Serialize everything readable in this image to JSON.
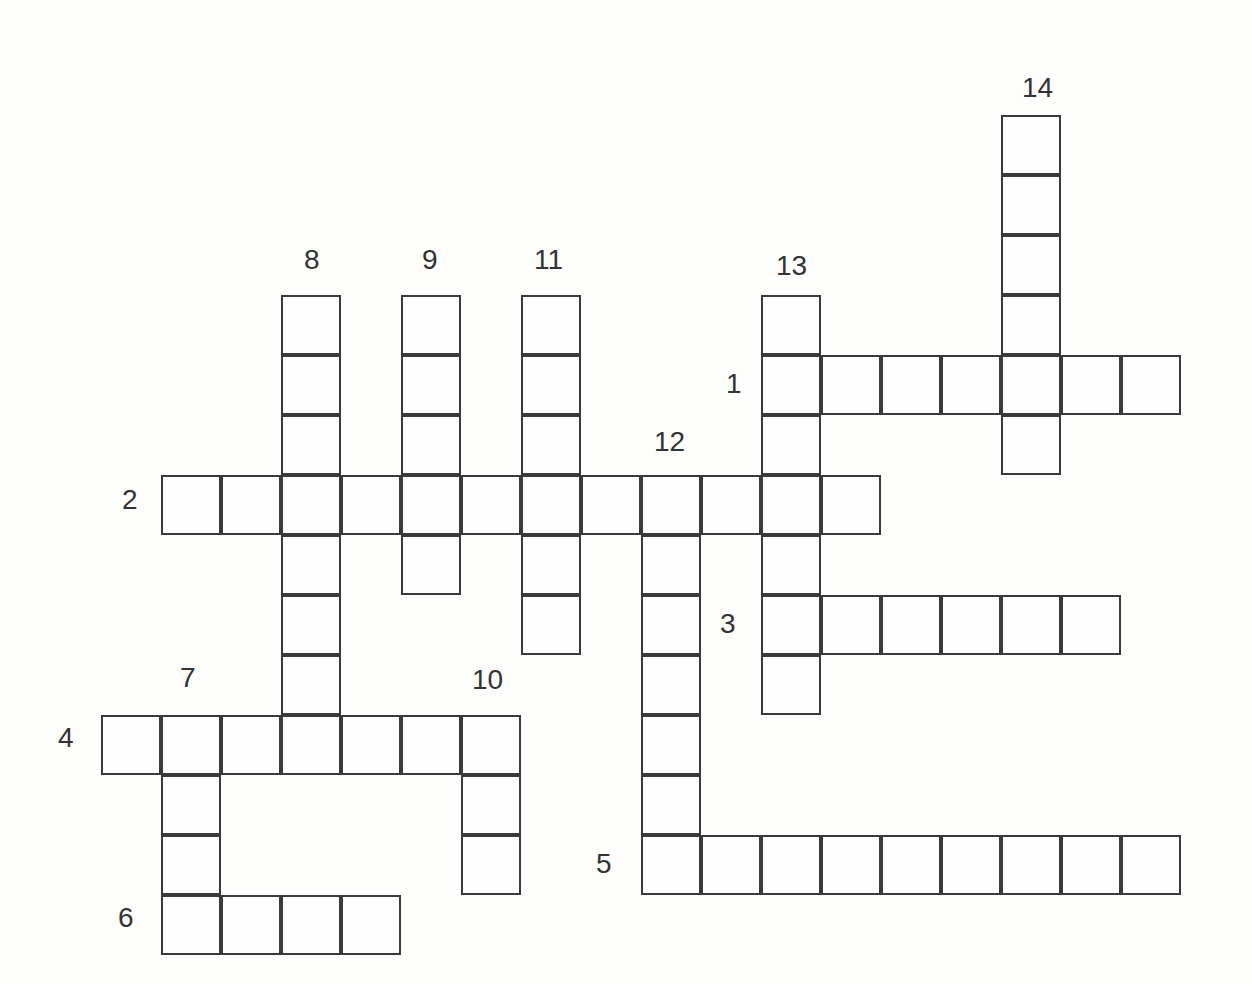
{
  "puzzle": {
    "type": "crossword",
    "origin": {
      "x": 102,
      "y": 116
    },
    "cell_size": 60,
    "line_color": "#3a3a3a",
    "background": "#fdfdfc",
    "entries": [
      {
        "number": "1",
        "direction": "across",
        "row": 4,
        "col": 11,
        "length": 7,
        "label_pos": {
          "x": 726,
          "y": 370
        }
      },
      {
        "number": "2",
        "direction": "across",
        "row": 6,
        "col": 1,
        "length": 12,
        "label_pos": {
          "x": 122,
          "y": 486
        }
      },
      {
        "number": "3",
        "direction": "across",
        "row": 8,
        "col": 11,
        "length": 6,
        "label_pos": {
          "x": 720,
          "y": 610
        }
      },
      {
        "number": "4",
        "direction": "across",
        "row": 10,
        "col": 0,
        "length": 7,
        "label_pos": {
          "x": 58,
          "y": 724
        }
      },
      {
        "number": "5",
        "direction": "across",
        "row": 12,
        "col": 9,
        "length": 9,
        "label_pos": {
          "x": 596,
          "y": 850
        }
      },
      {
        "number": "6",
        "direction": "across",
        "row": 13,
        "col": 1,
        "length": 4,
        "label_pos": {
          "x": 118,
          "y": 904
        }
      },
      {
        "number": "7",
        "direction": "down",
        "row": 10,
        "col": 1,
        "length": 4,
        "label_pos": {
          "x": 180,
          "y": 664
        }
      },
      {
        "number": "8",
        "direction": "down",
        "row": 3,
        "col": 3,
        "length": 8,
        "label_pos": {
          "x": 304,
          "y": 246
        }
      },
      {
        "number": "9",
        "direction": "down",
        "row": 3,
        "col": 5,
        "length": 5,
        "label_pos": {
          "x": 422,
          "y": 246
        }
      },
      {
        "number": "10",
        "direction": "down",
        "row": 10,
        "col": 6,
        "length": 3,
        "label_pos": {
          "x": 472,
          "y": 666
        }
      },
      {
        "number": "11",
        "direction": "down",
        "row": 3,
        "col": 7,
        "length": 6,
        "label_pos": {
          "x": 534,
          "y": 246
        }
      },
      {
        "number": "12",
        "direction": "down",
        "row": 6,
        "col": 9,
        "length": 7,
        "label_pos": {
          "x": 654,
          "y": 428
        }
      },
      {
        "number": "13",
        "direction": "down",
        "row": 3,
        "col": 11,
        "length": 7,
        "label_pos": {
          "x": 776,
          "y": 252
        }
      },
      {
        "number": "14",
        "direction": "down",
        "row": 0,
        "col": 15,
        "length": 6,
        "label_pos": {
          "x": 1022,
          "y": 74
        }
      }
    ]
  }
}
